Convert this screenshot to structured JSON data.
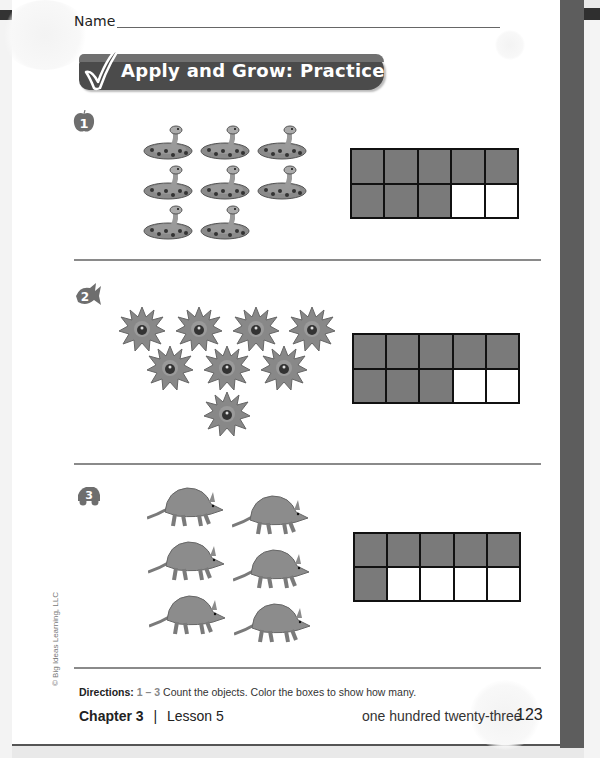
{
  "header": {
    "name_label": "Name",
    "banner_title": "Apply and Grow: Practice",
    "banner_icon": "checkmark-icon"
  },
  "problems": [
    {
      "number": "1",
      "badge_icon": "apple-badge-icon",
      "object": "rattlesnake",
      "object_icon": "snake-icon",
      "count": 8,
      "ten_frame": {
        "rows": 2,
        "cols": 5,
        "filled": 8
      }
    },
    {
      "number": "2",
      "badge_icon": "fish-badge-icon",
      "object": "sea anemone",
      "object_icon": "anemone-icon",
      "count": 8,
      "ten_frame": {
        "rows": 2,
        "cols": 5,
        "filled": 8
      }
    },
    {
      "number": "3",
      "badge_icon": "car-badge-icon",
      "object": "armadillo",
      "object_icon": "armadillo-icon",
      "count": 6,
      "ten_frame": {
        "rows": 2,
        "cols": 5,
        "filled": 6
      }
    }
  ],
  "footer": {
    "directions_label": "Directions:",
    "directions_range": "1 – 3",
    "directions_text": "Count the objects. Color the boxes to show how many.",
    "chapter": "Chapter 3",
    "separator": "|",
    "lesson": "Lesson 5",
    "page_words": "one hundred twenty-three",
    "page_number": "123",
    "copyright": "© Big Ideas Learning, LLC"
  },
  "colors": {
    "banner": "#4b4b4b",
    "filled_cell": "#7a7a7a",
    "border": "#111111",
    "separator": "#8a8a8a"
  }
}
